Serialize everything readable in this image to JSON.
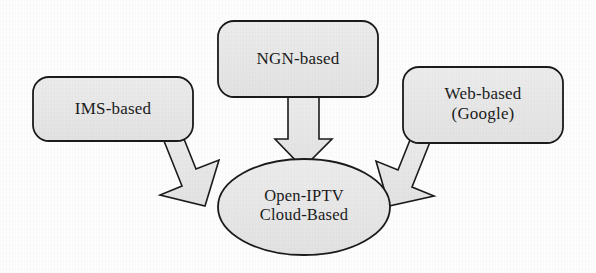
{
  "figure": {
    "type": "block-diagram",
    "background_color": "#fdfdfd",
    "shape_fill_color": "#e8e8e8",
    "shape_stroke_color": "#1b1b1b",
    "text_color": "#1b1b1b"
  },
  "nodes": [
    {
      "id": "ims",
      "shape": "rounded-rectangle",
      "label": "IMS-based",
      "lines": [
        "IMS-based"
      ],
      "x": 33,
      "y": 77,
      "width": 160,
      "height": 64
    },
    {
      "id": "ngn",
      "shape": "rounded-rectangle",
      "label": "NGN-based",
      "lines": [
        "NGN-based"
      ],
      "x": 218,
      "y": 21,
      "width": 160,
      "height": 76
    },
    {
      "id": "web",
      "shape": "rounded-rectangle",
      "label": "Web-based (Google)",
      "lines": [
        "Web-based",
        "(Google)"
      ],
      "x": 403,
      "y": 67,
      "width": 160,
      "height": 76
    },
    {
      "id": "cloud",
      "shape": "ellipse",
      "label": "Open-IPTV Cloud-Based",
      "lines": [
        "Open-IPTV",
        "Cloud-Based"
      ],
      "cx": 304,
      "cy": 207,
      "rx": 86,
      "ry": 48
    }
  ],
  "edges": [
    {
      "id": "ims-to-cloud",
      "from": "ims",
      "to": "cloud",
      "style": "block-arrow",
      "direction": "down-right"
    },
    {
      "id": "ngn-to-cloud",
      "from": "ngn",
      "to": "cloud",
      "style": "block-arrow",
      "direction": "down"
    },
    {
      "id": "web-to-cloud",
      "from": "web",
      "to": "cloud",
      "style": "block-arrow",
      "direction": "down-left"
    }
  ]
}
